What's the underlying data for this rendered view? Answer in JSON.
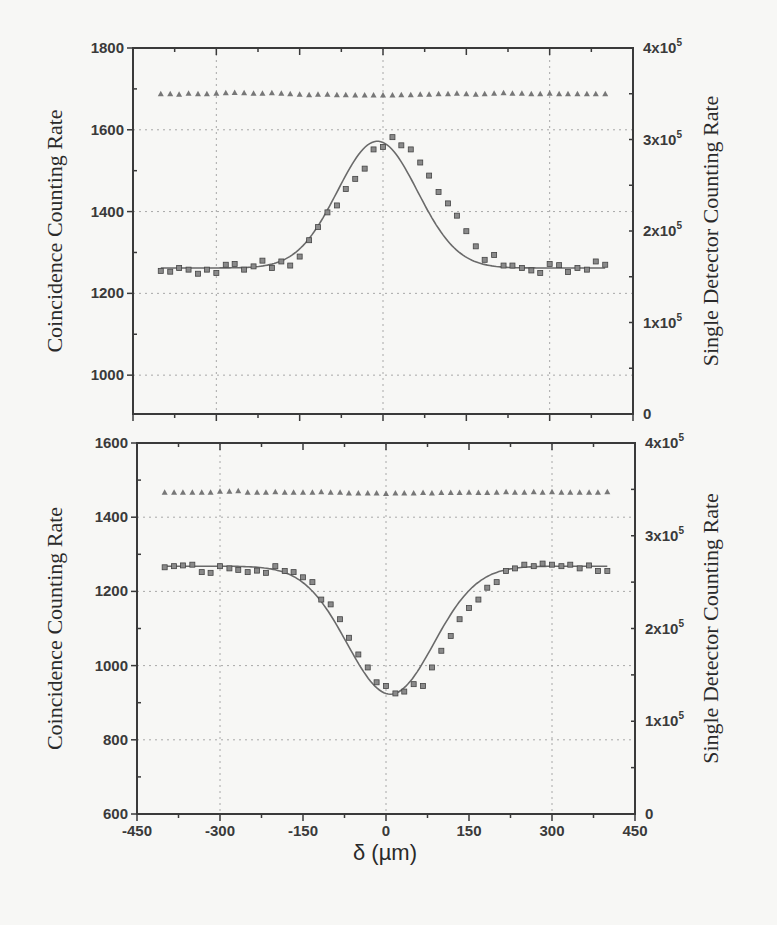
{
  "chart_data": [
    {
      "type": "scatter",
      "panel": "top",
      "title": "",
      "xlabel": "δ (µm)",
      "ylabel": "Coincidence Counting Rate",
      "y2label": "Single Detector Counting Rate",
      "xlim": [
        -450,
        450
      ],
      "ylim": [
        905,
        1800
      ],
      "y2lim": [
        0,
        400000
      ],
      "xticks": [
        -450,
        -300,
        -150,
        0,
        150,
        300,
        450
      ],
      "yticks": [
        1000,
        1200,
        1400,
        1600,
        1800
      ],
      "yticklabels": [
        "1000",
        "1200",
        "1400",
        "1600",
        "1800"
      ],
      "y2ticks": [
        0,
        100000,
        200000,
        300000,
        400000
      ],
      "y2ticklabels": [
        "0",
        "1x10⁵",
        "2x10⁵",
        "3x10⁵",
        "4x10⁵"
      ],
      "grid": true,
      "fit": {
        "model": "gaussian",
        "baseline": 1262,
        "amplitude": 310,
        "center": -10,
        "sigma": 72
      },
      "series": [
        {
          "name": "Coincidence counts (peak)",
          "marker": "square",
          "axis": "left",
          "x": [
            -400,
            -383,
            -367,
            -350,
            -333,
            -317,
            -300,
            -283,
            -267,
            -250,
            -233,
            -217,
            -200,
            -183,
            -167,
            -150,
            -133,
            -117,
            -100,
            -83,
            -67,
            -50,
            -33,
            -17,
            0,
            17,
            33,
            50,
            67,
            83,
            100,
            117,
            133,
            150,
            167,
            183,
            200,
            217,
            233,
            250,
            267,
            283,
            300,
            317,
            333,
            350,
            367,
            383,
            400
          ],
          "y": [
            1255,
            1253,
            1262,
            1258,
            1248,
            1258,
            1250,
            1270,
            1272,
            1258,
            1266,
            1280,
            1262,
            1278,
            1268,
            1290,
            1330,
            1362,
            1398,
            1415,
            1455,
            1480,
            1505,
            1552,
            1558,
            1582,
            1562,
            1552,
            1520,
            1488,
            1448,
            1420,
            1390,
            1352,
            1315,
            1282,
            1294,
            1268,
            1268,
            1262,
            1256,
            1250,
            1272,
            1269,
            1252,
            1262,
            1258,
            1278,
            1270,
            1282
          ]
        },
        {
          "name": "Single detector counts",
          "marker": "triangle",
          "axis": "right",
          "x": [
            -400,
            -383,
            -367,
            -350,
            -333,
            -317,
            -300,
            -283,
            -267,
            -250,
            -233,
            -217,
            -200,
            -183,
            -167,
            -150,
            -133,
            -117,
            -100,
            -83,
            -67,
            -50,
            -33,
            -17,
            0,
            17,
            33,
            50,
            67,
            83,
            100,
            117,
            133,
            150,
            167,
            183,
            200,
            217,
            233,
            250,
            267,
            283,
            300,
            317,
            333,
            350,
            367,
            383,
            400
          ],
          "y": [
            350000,
            350000,
            349500,
            350500,
            350000,
            350000,
            350500,
            351000,
            351500,
            351000,
            350500,
            350500,
            351000,
            350500,
            350000,
            349500,
            349000,
            349500,
            349500,
            349000,
            349000,
            348500,
            348500,
            348500,
            348500,
            348500,
            349000,
            349000,
            349500,
            349500,
            350000,
            350000,
            350500,
            350000,
            349500,
            350000,
            350500,
            351000,
            350500,
            350500,
            350000,
            350000,
            350500,
            350000,
            350000,
            350000,
            350000,
            350000,
            350000
          ]
        }
      ]
    },
    {
      "type": "scatter",
      "panel": "bottom",
      "title": "",
      "xlabel": "δ (µm)",
      "ylabel": "Coincidence Counting Rate",
      "y2label": "Single Detector Counting Rate",
      "xlim": [
        -450,
        450
      ],
      "ylim": [
        600,
        1600
      ],
      "y2lim": [
        0,
        400000
      ],
      "xticks": [
        -450,
        -300,
        -150,
        0,
        150,
        300,
        450
      ],
      "xticklabels": [
        "-450",
        "-300",
        "-150",
        "0",
        "150",
        "300",
        "450"
      ],
      "yticks": [
        600,
        800,
        1000,
        1200,
        1400,
        1600
      ],
      "yticklabels": [
        "600",
        "800",
        "1000",
        "1200",
        "1400",
        "1600"
      ],
      "y2ticks": [
        0,
        100000,
        200000,
        300000,
        400000
      ],
      "y2ticklabels": [
        "0",
        "1x10⁵",
        "2x10⁵",
        "3x10⁵",
        "4x10⁵"
      ],
      "grid": true,
      "fit": {
        "model": "gaussian",
        "baseline": 1268,
        "amplitude": -345,
        "center": 8,
        "sigma": 78
      },
      "series": [
        {
          "name": "Coincidence counts (dip)",
          "marker": "square",
          "axis": "left",
          "x": [
            -400,
            -383,
            -367,
            -350,
            -333,
            -317,
            -300,
            -283,
            -267,
            -250,
            -233,
            -217,
            -200,
            -183,
            -167,
            -150,
            -133,
            -117,
            -100,
            -83,
            -67,
            -50,
            -33,
            -17,
            0,
            17,
            33,
            50,
            67,
            83,
            100,
            117,
            133,
            150,
            167,
            183,
            200,
            217,
            233,
            250,
            267,
            283,
            300,
            317,
            333,
            350,
            367,
            383,
            400
          ],
          "y": [
            1265,
            1268,
            1270,
            1272,
            1252,
            1250,
            1268,
            1262,
            1258,
            1252,
            1256,
            1250,
            1268,
            1255,
            1252,
            1238,
            1225,
            1178,
            1165,
            1125,
            1075,
            1030,
            995,
            955,
            945,
            925,
            930,
            950,
            945,
            995,
            1040,
            1080,
            1125,
            1155,
            1178,
            1210,
            1225,
            1255,
            1262,
            1272,
            1268,
            1275,
            1272,
            1268,
            1272,
            1262,
            1270,
            1255,
            1255,
            1290,
            1265,
            1275
          ]
        },
        {
          "name": "Single detector counts",
          "marker": "triangle",
          "axis": "right",
          "x": [
            -400,
            -383,
            -367,
            -350,
            -333,
            -317,
            -300,
            -283,
            -267,
            -250,
            -233,
            -217,
            -200,
            -183,
            -167,
            -150,
            -133,
            -117,
            -100,
            -83,
            -67,
            -50,
            -33,
            -17,
            0,
            17,
            33,
            50,
            67,
            83,
            100,
            117,
            133,
            150,
            167,
            183,
            200,
            217,
            233,
            250,
            267,
            283,
            300,
            317,
            333,
            350,
            367,
            383,
            400
          ],
          "y": [
            347000,
            347000,
            347000,
            347000,
            347000,
            347000,
            348000,
            348000,
            348500,
            347000,
            347000,
            347000,
            347500,
            347000,
            347000,
            347000,
            347000,
            347500,
            347000,
            347000,
            346000,
            346000,
            346000,
            346000,
            345500,
            346000,
            346000,
            346000,
            346500,
            346000,
            346500,
            346500,
            346500,
            347000,
            346500,
            346500,
            347000,
            347500,
            347000,
            347000,
            347500,
            347000,
            347500,
            347000,
            347000,
            347000,
            347000,
            347000,
            347500
          ]
        }
      ]
    }
  ],
  "labels": {
    "top_ylabel": "Coincidence Counting Rate",
    "top_y2label": "Single Detector Counting Rate",
    "bottom_ylabel": "Coincidence Counting Rate",
    "bottom_y2label": "Single Detector Counting Rate",
    "xlabel": "δ (µm)"
  },
  "colors": {
    "frame": "#3a3a3a",
    "grid": "#a8a8a8",
    "marker": "#777777",
    "fit": "#6a6a6a",
    "background": "#f7f7f5"
  }
}
